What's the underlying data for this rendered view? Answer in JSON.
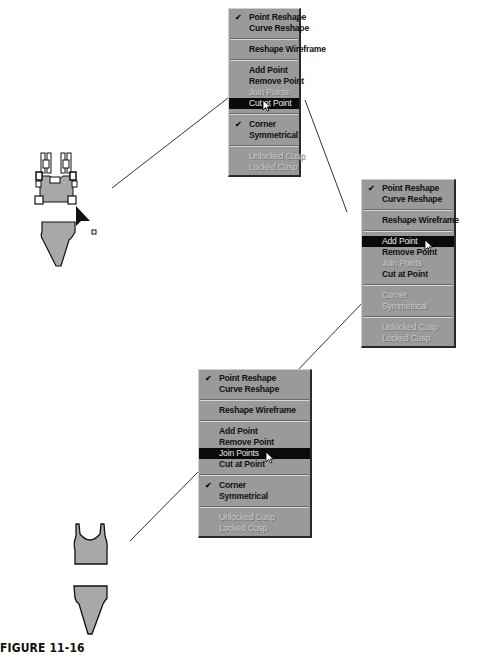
{
  "menu_items_common": {
    "point_reshape": "Point Reshape",
    "curve_reshape": "Curve Reshape",
    "reshape_wireframe": "Reshape Wireframe",
    "add_point": "Add Point",
    "remove_point": "Remove Point",
    "join_points": "Join Points",
    "cut_at_point": "Cut at Point",
    "corner": "Corner",
    "symmetrical": "Symmetrical",
    "unlocked_cusp": "Unlocked Cusp",
    "locked_cusp": "Locked Cusp"
  },
  "menu1": {
    "checked": [
      "Point Reshape",
      "Corner"
    ],
    "highlighted": "Cut at Point",
    "disabled": [
      "Join Points",
      "Unlocked Cusp",
      "Locked Cusp"
    ]
  },
  "menu2": {
    "checked": [
      "Point Reshape"
    ],
    "highlighted": "Add Point",
    "disabled": [
      "Join Points",
      "Corner",
      "Symmetrical",
      "Unlocked Cusp",
      "Locked Cusp"
    ]
  },
  "menu3": {
    "checked": [
      "Point Reshape",
      "Corner"
    ],
    "highlighted": "Join Points",
    "disabled": [
      "Unlocked Cusp",
      "Locked Cusp"
    ]
  },
  "icons": {
    "check": "✔"
  },
  "colors": {
    "menu_bg": "#9a9a9a",
    "highlight_bg": "#0a0a0a",
    "garment_fill": "#a8a8a8"
  },
  "caption": "FIGURE 11-16"
}
